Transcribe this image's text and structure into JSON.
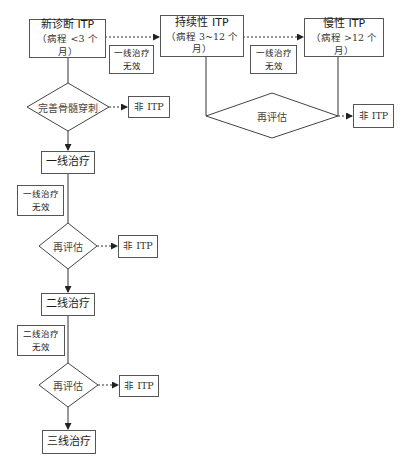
{
  "stages": {
    "new": {
      "title": "新诊断 ITP",
      "subtitle": "（病程 <3 个月）"
    },
    "persistent": {
      "title": "持续性 ITP",
      "subtitle": "（病程 3~12 个月）"
    },
    "chronic": {
      "title": "慢性 ITP",
      "subtitle": "（病程 >12 个月）"
    }
  },
  "transition_labels": {
    "new_to_persistent": [
      "一线治疗",
      "无效"
    ],
    "persistent_to_chronic": [
      "一线治疗",
      "无效"
    ]
  },
  "decisions": {
    "bone_marrow": "完善骨髓穿刺",
    "reassess_top": "再评估",
    "reassess_first": "再评估",
    "reassess_second": "再评估"
  },
  "non_itp_label": "非 ITP",
  "treatments": {
    "first_line": "一线治疗",
    "second_line": "二线治疗",
    "third_line": "三线治疗"
  },
  "failure_labels": {
    "first_line": [
      "一线治疗",
      "无效"
    ],
    "second_line": [
      "二线治疗",
      "无效"
    ]
  }
}
